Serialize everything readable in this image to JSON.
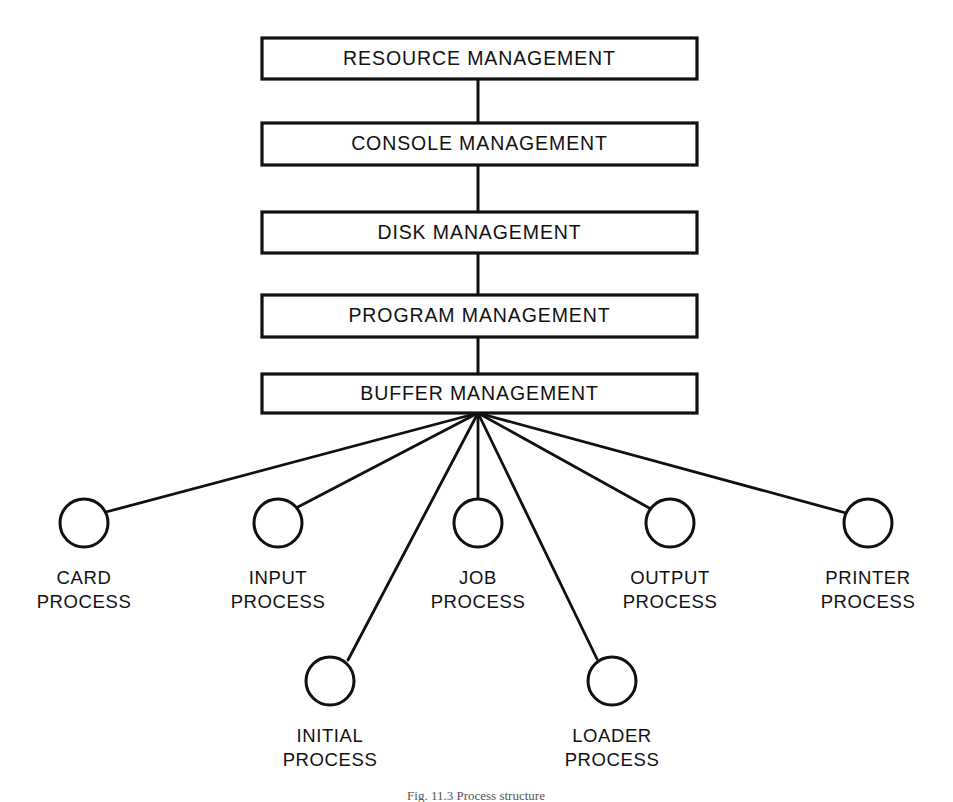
{
  "diagram": {
    "caption": "Fig. 11.3   Process structure",
    "background_color": "#ffffff",
    "line_color": "#101010",
    "layers": [
      {
        "id": "resource-management",
        "label": "RESOURCE MANAGEMENT",
        "x": 262,
        "y": 38,
        "width": 435,
        "height": 41
      },
      {
        "id": "console-management",
        "label": "CONSOLE MANAGEMENT",
        "x": 262,
        "y": 123,
        "width": 435,
        "height": 42
      },
      {
        "id": "disk-management",
        "label": "DISK MANAGEMENT",
        "x": 262,
        "y": 212,
        "width": 435,
        "height": 41
      },
      {
        "id": "program-management",
        "label": "PROGRAM MANAGEMENT",
        "x": 262,
        "y": 295,
        "width": 435,
        "height": 42
      },
      {
        "id": "buffer-management",
        "label": "BUFFER MANAGEMENT",
        "x": 262,
        "y": 374,
        "width": 435,
        "height": 39
      }
    ],
    "vertical_connectors": [
      {
        "x": 478,
        "y1": 79,
        "y2": 123
      },
      {
        "x": 478,
        "y1": 165,
        "y2": 212
      },
      {
        "x": 478,
        "y1": 253,
        "y2": 295
      },
      {
        "x": 478,
        "y1": 337,
        "y2": 374
      }
    ],
    "fan_origin": {
      "x": 478,
      "y": 413
    },
    "process_radius": 24,
    "processes": [
      {
        "id": "card-process",
        "label_line1": "CARD",
        "label_line2": "PROCESS",
        "cx": 84,
        "cy": 523,
        "label_x": 84,
        "label_y1": 584,
        "label_y2": 608
      },
      {
        "id": "input-process",
        "label_line1": "INPUT",
        "label_line2": "PROCESS",
        "cx": 278,
        "cy": 523,
        "label_x": 278,
        "label_y1": 584,
        "label_y2": 608
      },
      {
        "id": "initial-process",
        "label_line1": "INITIAL",
        "label_line2": "PROCESS",
        "cx": 330,
        "cy": 681,
        "label_x": 330,
        "label_y1": 742,
        "label_y2": 766
      },
      {
        "id": "job-process",
        "label_line1": "JOB",
        "label_line2": "PROCESS",
        "cx": 478,
        "cy": 523,
        "label_x": 478,
        "label_y1": 584,
        "label_y2": 608
      },
      {
        "id": "loader-process",
        "label_line1": "LOADER",
        "label_line2": "PROCESS",
        "cx": 612,
        "cy": 681,
        "label_x": 612,
        "label_y1": 742,
        "label_y2": 766
      },
      {
        "id": "output-process",
        "label_line1": "OUTPUT",
        "label_line2": "PROCESS",
        "cx": 670,
        "cy": 523,
        "label_x": 670,
        "label_y1": 584,
        "label_y2": 608
      },
      {
        "id": "printer-process",
        "label_line1": "PRINTER",
        "label_line2": "PROCESS",
        "cx": 868,
        "cy": 523,
        "label_x": 868,
        "label_y1": 584,
        "label_y2": 608
      }
    ]
  }
}
